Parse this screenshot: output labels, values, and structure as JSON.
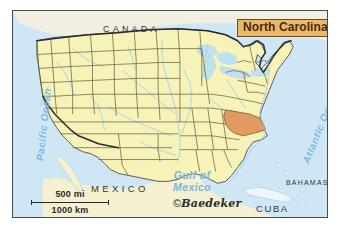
{
  "map": {
    "title_plate": {
      "label": "North Carolina",
      "bg_color": "#e8b96b",
      "text_color": "#4a2c08",
      "border_color": "#6b4a18"
    },
    "country_labels": [
      {
        "name": "canada",
        "text": "CANADA"
      },
      {
        "name": "mexico",
        "text": "MEXICO"
      },
      {
        "name": "cuba",
        "text": "CUBA"
      },
      {
        "name": "bahamas",
        "text": "BAHAMAS"
      }
    ],
    "water_labels": [
      {
        "name": "pacific-ocean",
        "text": "Pacific Ocean"
      },
      {
        "name": "atlantic-ocean",
        "text": "Atlantic Ocean"
      },
      {
        "name": "gulf-of-mexico",
        "line1": "Gulf of",
        "line2": "Mexico"
      }
    ],
    "scale": {
      "miles": "500 mi",
      "kilometers": "1000 km"
    },
    "credit": {
      "symbol": "©",
      "text": "Baedeker"
    },
    "colors": {
      "ocean": "#cfe7f5",
      "land_us": "#f7f2b8",
      "land_foreign": "#ddeef8",
      "highlight_state": "#e09a62",
      "state_border": "#6b6040",
      "national_border": "#2b2b31",
      "river": "#9fd2e8",
      "frame": "#4a4a52",
      "page_background": "#ffffff"
    },
    "highlighted_region": "North Carolina"
  }
}
